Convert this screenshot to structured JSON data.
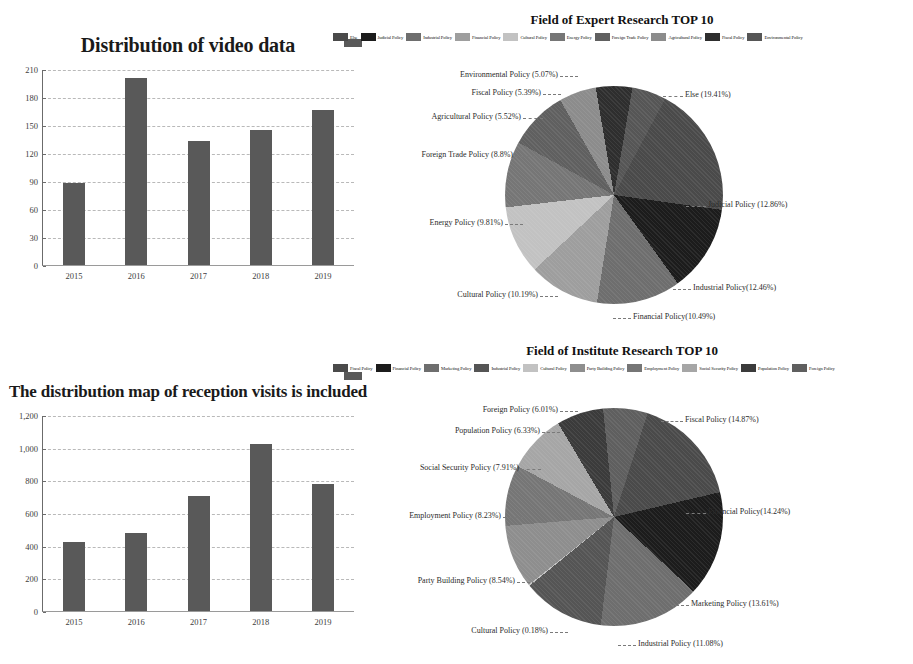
{
  "charts": {
    "bar_top": {
      "title": "Distribution of video data",
      "legend_label": "",
      "yticks": [
        "210",
        "180",
        "150",
        "120",
        "90",
        "60",
        "30",
        "0"
      ]
    },
    "bar_bottom": {
      "title": "The distribution map of reception visits is included",
      "legend_label": "",
      "yticks": [
        "1,200",
        "1,000",
        "800",
        "600",
        "400",
        "200",
        "0"
      ]
    },
    "pie_top": {
      "title": "Field of Expert Research TOP 10"
    },
    "pie_bottom": {
      "title": "Field of Institute Research TOP 10"
    }
  },
  "chart_data": [
    {
      "type": "bar",
      "title": "Distribution of video data",
      "categories": [
        "2015",
        "2016",
        "2017",
        "2018",
        "2019"
      ],
      "values": [
        88,
        200,
        133,
        145,
        166
      ],
      "xlabel": "",
      "ylabel": "",
      "ylim": [
        0,
        210
      ],
      "ytick_values": [
        0,
        30,
        60,
        90,
        120,
        150,
        180,
        210
      ],
      "grid": true,
      "legend": false,
      "series_color": "#595959"
    },
    {
      "type": "bar",
      "title": "The distribution map of reception visits is included",
      "categories": [
        "2015",
        "2016",
        "2017",
        "2018",
        "2019"
      ],
      "values": [
        420,
        480,
        705,
        1020,
        780
      ],
      "xlabel": "",
      "ylabel": "",
      "ylim": [
        0,
        1200
      ],
      "ytick_values": [
        0,
        200,
        400,
        600,
        800,
        1000,
        1200
      ],
      "grid": true,
      "legend": false,
      "series_color": "#595959"
    },
    {
      "type": "pie",
      "title": "Field of Expert Research TOP 10",
      "legend_position": "top",
      "labels": [
        "Else",
        "Judicial Policy",
        "Industrial Policy",
        "Financial Policy",
        "Cultural Policy",
        "Energy Policy",
        "Foreign Trade Policy",
        "Agricultural Policy",
        "Fiscal Policy",
        "Environmental Policy"
      ],
      "values": [
        19.41,
        12.86,
        12.46,
        10.49,
        10.19,
        9.81,
        8.8,
        5.52,
        5.39,
        5.07
      ],
      "value_labels": [
        "Else  (19.41%)",
        "Judicial Policy (12.86%)",
        "Industrial Policy(12.46%)",
        "Financial Policy(10.49%)",
        "Cultural Policy (10.19%)",
        "Energy Policy (9.81%)",
        "Foreign Trade Policy (8.8%)",
        "Agricultural Policy  (5.52%)",
        "Fiscal  Policy (5.39%)",
        "Environmental Policy  (5.07%)"
      ],
      "colors": [
        "#4a4a4a",
        "#1c1c1c",
        "#6e6e6e",
        "#9e9e9e",
        "#c2c2c2",
        "#767676",
        "#606060",
        "#8c8c8c",
        "#2e2e2e",
        "#565656"
      ]
    },
    {
      "type": "pie",
      "title": "Field of Institute Research TOP 10",
      "legend_position": "top",
      "labels": [
        "Fiscal Policy",
        "Financial Policy",
        "Marketing Policy",
        "Industrial Policy",
        "Cultural Policy",
        "Party Building Policy",
        "Employment Policy",
        "Social Security Policy",
        "Population Policy",
        "Foreign Policy"
      ],
      "values": [
        14.87,
        14.24,
        13.61,
        11.08,
        0.18,
        8.54,
        8.23,
        7.91,
        6.33,
        6.01
      ],
      "value_labels": [
        "Fiscal Policy (14.87%)",
        "Financial Policy(14.24%)",
        "Marketing  Policy (13.61%)",
        "Industrial Policy (11.08%)",
        "Cultural Policy (0.18%)",
        "Party Building Policy  (8.54%)",
        "Employment Policy  (8.23%)",
        "Social Security Policy  (7.91%)",
        "Population Policy  (6.33%)",
        "Foreign Policy  (6.01%)"
      ],
      "colors": [
        "#4a4a4a",
        "#1c1c1c",
        "#6e6e6e",
        "#555555",
        "#c2c2c2",
        "#8e8e8e",
        "#767676",
        "#a6a6a6",
        "#3b3b3b",
        "#5f5f5f"
      ]
    }
  ]
}
